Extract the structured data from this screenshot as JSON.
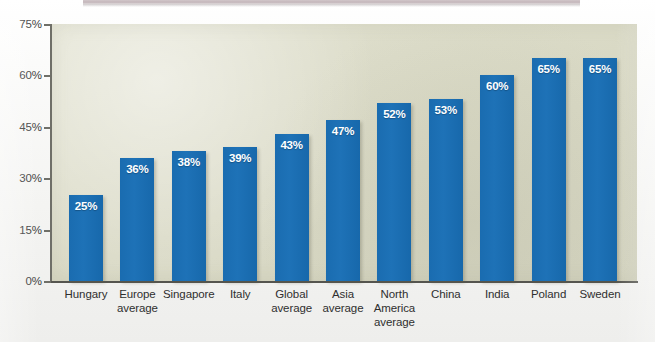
{
  "chart_data": {
    "type": "bar",
    "title": "",
    "xlabel": "",
    "ylabel": "",
    "ylim": [
      0,
      75
    ],
    "grid": false,
    "legend": "none",
    "y_ticks": [
      "0%",
      "15%",
      "30%",
      "45%",
      "60%",
      "75%"
    ],
    "y_tick_values": [
      0,
      15,
      30,
      45,
      60,
      75
    ],
    "categories": [
      "Hungary",
      "Europe average",
      "Singapore",
      "Italy",
      "Global average",
      "Asia average",
      "North America average",
      "China",
      "India",
      "Poland",
      "Sweden"
    ],
    "category_lines": [
      [
        "Hungary"
      ],
      [
        "Europe",
        "average"
      ],
      [
        "Singapore"
      ],
      [
        "Italy"
      ],
      [
        "Global",
        "average"
      ],
      [
        "Asia",
        "average"
      ],
      [
        "North",
        "America",
        "average"
      ],
      [
        "China"
      ],
      [
        "India"
      ],
      [
        "Poland"
      ],
      [
        "Sweden"
      ]
    ],
    "values": [
      25,
      36,
      38,
      39,
      43,
      47,
      52,
      53,
      60,
      65,
      65
    ],
    "value_labels": [
      "25%",
      "36%",
      "38%",
      "39%",
      "43%",
      "47%",
      "52%",
      "53%",
      "60%",
      "65%",
      "65%"
    ],
    "colors": {
      "bar": "#1a6cb0",
      "bar_label": "#ffffff",
      "plot_background": "#dcdcc9",
      "page_background": "#f4f4f2",
      "axis": "#55554f",
      "tick_label": "#3b3b3b",
      "category_label": "#2f2f2f",
      "top_strip": "#b9a9ae"
    }
  }
}
